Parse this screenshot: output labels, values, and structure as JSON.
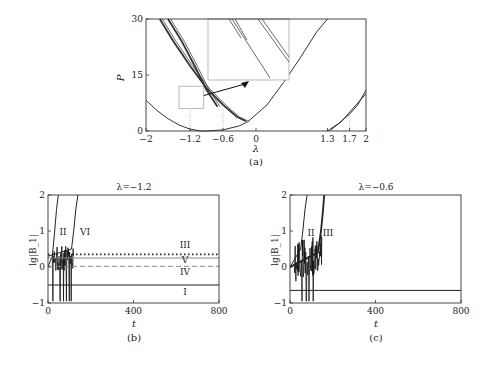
{
  "chart_data": [
    {
      "id": "a",
      "type": "line",
      "caption": "(a)",
      "xlabel": "λ",
      "ylabel": "P",
      "xlim": [
        -2,
        2
      ],
      "ylim": [
        0,
        30
      ],
      "xticks": [
        -2,
        -1.2,
        -0.6,
        0,
        1.3,
        1.7,
        2
      ],
      "xtick_labels": [
        "−2",
        "−1.2",
        "−0.6",
        "0",
        "1.3",
        "1.7",
        "2"
      ],
      "yticks": [
        0,
        15,
        30
      ],
      "ytick_labels": [
        "0",
        "15",
        "30"
      ],
      "reference_lines_x": [
        -1.2,
        -0.6,
        1.7
      ],
      "zoom_box": {
        "x": [
          -1.4,
          -0.95
        ],
        "y": [
          6,
          12
        ]
      },
      "inset_note": "magnified view of boxed region",
      "series": [
        {
          "name": "left-parabola",
          "x": [
            -2,
            -1.8,
            -1.6,
            -1.4,
            -1.2,
            -1.0,
            -0.9
          ],
          "y": [
            8.2,
            5.5,
            3.3,
            1.6,
            0.5,
            0.0,
            0.0
          ]
        },
        {
          "name": "right-parabola",
          "x": [
            -0.9,
            -0.6,
            -0.3,
            -0.15,
            0.2,
            0.5,
            0.8,
            1.1,
            1.3
          ],
          "y": [
            0.0,
            0.3,
            1.4,
            2.5,
            7.0,
            13.0,
            19.5,
            26.5,
            30.0
          ]
        },
        {
          "name": "branch-outer",
          "x": [
            -1.75,
            -1.5,
            -1.2,
            -0.9,
            -0.6,
            -0.35,
            -0.18
          ],
          "y": [
            30.0,
            24.0,
            17.5,
            11.5,
            7.0,
            3.8,
            2.6
          ]
        },
        {
          "name": "branch-inner",
          "x": [
            -1.6,
            -1.35,
            -1.1,
            -0.9,
            -0.7
          ],
          "y": [
            30.0,
            24.0,
            17.0,
            11.0,
            6.5
          ]
        },
        {
          "name": "right-branch-1",
          "x": [
            1.3,
            1.5,
            1.7,
            1.85,
            2.0
          ],
          "y": [
            0.0,
            2.0,
            4.5,
            7.0,
            11.0
          ]
        },
        {
          "name": "right-branch-2",
          "x": [
            1.35,
            1.55,
            1.7,
            1.85,
            2.0
          ],
          "y": [
            0.2,
            2.5,
            5.0,
            7.5,
            10.0
          ]
        }
      ]
    },
    {
      "id": "b",
      "type": "line",
      "title": "λ=−1.2",
      "caption": "(b)",
      "xlabel": "t",
      "ylabel": "lg|B_1|",
      "xlim": [
        0,
        800
      ],
      "ylim": [
        -1,
        2
      ],
      "xticks": [
        0,
        400,
        800
      ],
      "yticks": [
        -1,
        0,
        1,
        2
      ],
      "series": [
        {
          "name": "I",
          "style": "solid",
          "x": [
            0,
            800
          ],
          "y": [
            -0.5,
            -0.5
          ]
        },
        {
          "name": "II",
          "style": "solid",
          "x": [
            0,
            20,
            30,
            40,
            48
          ],
          "y": [
            0.0,
            0.3,
            0.9,
            1.6,
            2.0
          ]
        },
        {
          "name": "III",
          "style": "dotted",
          "x": [
            0,
            800
          ],
          "y": [
            0.35,
            0.35
          ]
        },
        {
          "name": "IV",
          "style": "dashed",
          "x": [
            0,
            800
          ],
          "y": [
            0.02,
            0.02
          ]
        },
        {
          "name": "V",
          "style": "solid-light",
          "x": [
            0,
            800
          ],
          "y": [
            0.25,
            0.25
          ]
        },
        {
          "name": "VI",
          "style": "solid",
          "x": [
            0,
            110,
            120,
            130,
            140
          ],
          "y": [
            0.3,
            0.5,
            1.0,
            1.6,
            2.0
          ]
        }
      ],
      "labels": [
        "I",
        "II",
        "III",
        "IV",
        "V",
        "VI"
      ]
    },
    {
      "id": "c",
      "type": "line",
      "title": "λ=−0.6",
      "caption": "(c)",
      "xlabel": "t",
      "ylabel": "lg|B_1|",
      "xlim": [
        0,
        800
      ],
      "ylim": [
        -1,
        2
      ],
      "xticks": [
        0,
        400,
        800
      ],
      "yticks": [
        -1,
        0,
        1,
        2
      ],
      "series": [
        {
          "name": "baseline",
          "style": "solid",
          "x": [
            0,
            800
          ],
          "y": [
            -0.65,
            -0.65
          ]
        },
        {
          "name": "II",
          "style": "solid",
          "x": [
            0,
            50,
            60,
            70,
            80
          ],
          "y": [
            0.0,
            0.5,
            1.0,
            1.6,
            2.0
          ]
        },
        {
          "name": "III",
          "style": "solid-bold",
          "x": [
            0,
            130,
            145,
            155,
            160
          ],
          "y": [
            0.0,
            0.4,
            1.0,
            1.6,
            2.0
          ]
        }
      ],
      "labels": [
        "II",
        "III"
      ]
    }
  ]
}
